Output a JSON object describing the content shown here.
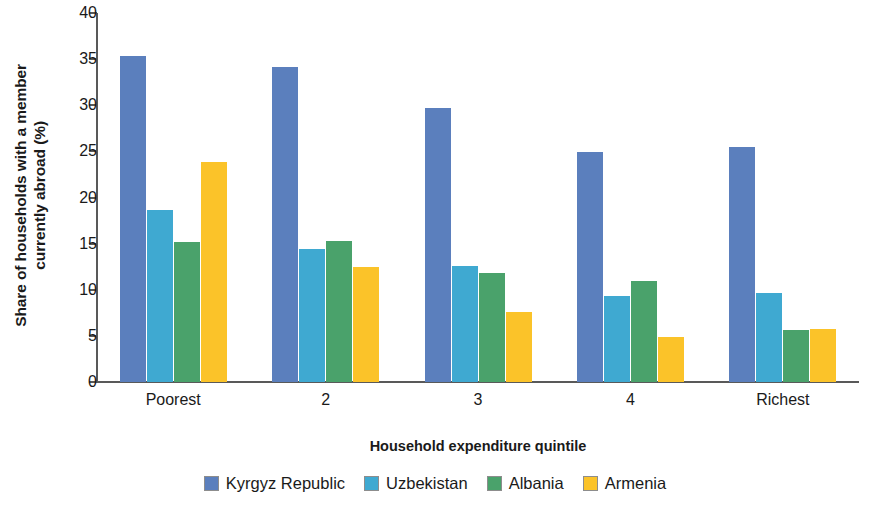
{
  "chart_data": {
    "type": "bar",
    "title": "",
    "xlabel": "Household expenditure quintile",
    "ylabel": "Share of households with a member currently abroad (%)",
    "categories": [
      "Poorest",
      "2",
      "3",
      "4",
      "Richest"
    ],
    "ylim": [
      0,
      40
    ],
    "yticks": [
      0,
      5,
      10,
      15,
      20,
      25,
      30,
      35,
      40
    ],
    "grid": false,
    "legend_position": "bottom",
    "series": [
      {
        "name": "Kyrgyz Republic",
        "color": "#5b7fbd",
        "values": [
          35.3,
          34.2,
          29.7,
          24.9,
          25.5
        ]
      },
      {
        "name": "Uzbekistan",
        "color": "#3fa9d1",
        "values": [
          18.6,
          14.4,
          12.6,
          9.3,
          9.7
        ]
      },
      {
        "name": "Albania",
        "color": "#4aa26b",
        "values": [
          15.2,
          15.3,
          11.8,
          11.0,
          5.6
        ]
      },
      {
        "name": "Armenia",
        "color": "#fbc329",
        "values": [
          23.8,
          12.5,
          7.6,
          4.9,
          5.7
        ]
      }
    ]
  },
  "ylabel_line1": "Share of households with a member",
  "ylabel_line2": "currently abroad (%)"
}
